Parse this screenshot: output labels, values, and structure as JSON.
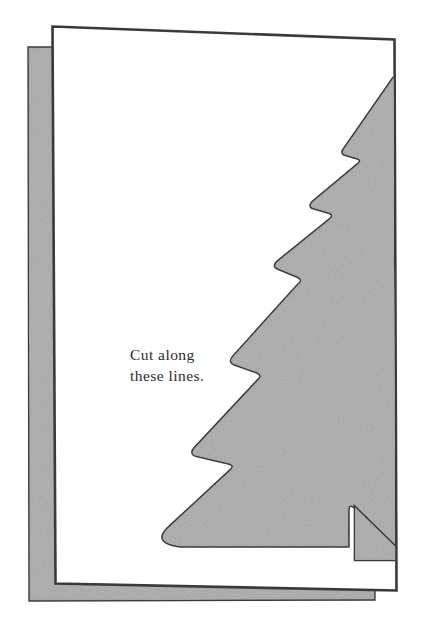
{
  "figure": {
    "instruction_text": "Cut along\nthese lines.",
    "instruction_line_1": "Cut along",
    "instruction_line_2": "these lines.",
    "colors": {
      "page_white": "#ffffff",
      "shaded_gray": "#ababab",
      "outline_dark": "#3a3a3a",
      "text_ink": "#2b2b2b",
      "background": "#ffffff"
    },
    "parts": [
      {
        "name": "back-panel",
        "label": "Back panel of folded card",
        "fill": "#ababab"
      },
      {
        "name": "front-panel",
        "label": "Front panel of folded card",
        "fill": "#ffffff"
      },
      {
        "name": "tree-cutout",
        "label": "Half Christmas tree shape to cut",
        "fill": "#ababab"
      },
      {
        "name": "tree-trunk",
        "label": "Tree trunk notch",
        "fill": "#ababab"
      }
    ]
  }
}
